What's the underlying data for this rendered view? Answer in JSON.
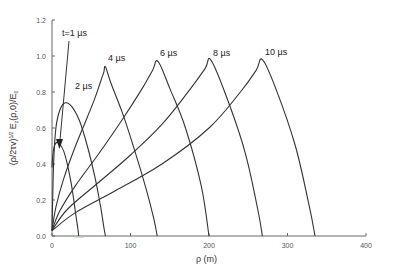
{
  "chart_data": {
    "type": "line",
    "title": "",
    "xlabel": "ρ (m)",
    "ylabel": "(ρ/2τv)^1/2 E_z(ρ,0)/E_0",
    "xlim": [
      0,
      400
    ],
    "ylim": [
      0,
      1.2
    ],
    "xticks": [
      0,
      100,
      200,
      300,
      400
    ],
    "yticks": [
      0.0,
      0.2,
      0.4,
      0.6,
      0.8,
      1.0,
      1.2
    ],
    "xtick_labels": [
      "0",
      "100",
      "200",
      "300",
      "400"
    ],
    "ytick_labels": [
      "0.0",
      "0.2",
      "0.4",
      "0.6",
      "0.8",
      "1.0",
      "1.2"
    ],
    "grid": false,
    "legend": "none (curves labeled directly)",
    "series": [
      {
        "name": "t=1 µs",
        "label": "t=1 µs",
        "x": [
          0,
          1,
          3,
          6,
          10,
          15,
          20,
          25,
          30,
          33,
          34
        ],
        "y": [
          0.38,
          0.45,
          0.5,
          0.52,
          0.51,
          0.47,
          0.39,
          0.28,
          0.13,
          0.04,
          0.0
        ]
      },
      {
        "name": "2 µs",
        "label": "2 µs",
        "x": [
          0,
          2,
          5,
          10,
          17,
          25,
          35,
          45,
          55,
          62,
          66,
          68
        ],
        "y": [
          0.03,
          0.4,
          0.6,
          0.7,
          0.74,
          0.72,
          0.64,
          0.5,
          0.32,
          0.16,
          0.05,
          0.0
        ]
      },
      {
        "name": "4 µs",
        "label": "4 µs",
        "x": [
          0,
          5,
          15,
          30,
          45,
          55,
          62,
          66,
          68,
          75,
          90,
          105,
          120,
          130,
          134
        ],
        "y": [
          0.03,
          0.16,
          0.32,
          0.5,
          0.66,
          0.77,
          0.86,
          0.91,
          0.94,
          0.85,
          0.68,
          0.48,
          0.26,
          0.09,
          0.0
        ]
      },
      {
        "name": "6 µs",
        "label": "6 µs",
        "x": [
          0,
          10,
          30,
          60,
          90,
          115,
          128,
          135,
          150,
          170,
          190,
          200
        ],
        "y": [
          0.03,
          0.14,
          0.28,
          0.46,
          0.65,
          0.82,
          0.92,
          0.97,
          0.82,
          0.6,
          0.28,
          0.0
        ]
      },
      {
        "name": "8 µs",
        "label": "8 µs",
        "x": [
          0,
          20,
          60,
          100,
          140,
          175,
          195,
          202,
          220,
          245,
          262,
          268
        ],
        "y": [
          0.03,
          0.15,
          0.3,
          0.45,
          0.62,
          0.81,
          0.93,
          0.98,
          0.8,
          0.48,
          0.15,
          0.0
        ]
      },
      {
        "name": "10 µs",
        "label": "10 µs",
        "x": [
          0,
          30,
          80,
          140,
          200,
          240,
          260,
          268,
          285,
          310,
          328,
          335
        ],
        "y": [
          0.03,
          0.13,
          0.25,
          0.4,
          0.6,
          0.8,
          0.92,
          0.98,
          0.82,
          0.5,
          0.16,
          0.0
        ]
      }
    ],
    "annotations": [
      {
        "text": "t=1 µs",
        "type": "arrow",
        "from": [
          10,
          1.07
        ],
        "to": [
          5,
          0.53
        ]
      }
    ]
  },
  "labels": {
    "t1": "t=1 µs",
    "t2": "2 µs",
    "t4": "4 µs",
    "t6": "6 µs",
    "t8": "8 µs",
    "t10": "10 µs",
    "xlabel": "ρ (m)",
    "ylabel": "(ρ/2τv)1/2 Ez(ρ,0)/E0"
  }
}
